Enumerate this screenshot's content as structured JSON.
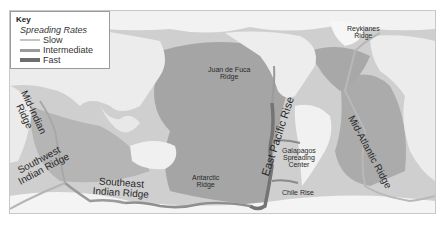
{
  "key": {
    "title": "Key",
    "subtitle": "Spreading Rates",
    "items": [
      {
        "label": "Slow",
        "color": "#c4c4c4",
        "width": 2
      },
      {
        "label": "Intermediate",
        "color": "#9a9a9a",
        "width": 3
      },
      {
        "label": "Fast",
        "color": "#6e6e6e",
        "width": 4
      }
    ]
  },
  "ridges": {
    "reykjanes": "Reykjanes Ridge",
    "reykjanes_l1": "Reykjanes",
    "reykjanes_l2": "Ridge",
    "juan_de_fuca_l1": "Juan de Fuca",
    "juan_de_fuca_l2": "Ridge",
    "mid_indian_l1": "Mid-Indian",
    "mid_indian_l2": "Ridge",
    "southwest_indian_l1": "Southwest",
    "southwest_indian_l2": "Indian Ridge",
    "southeast_indian_l1": "Southeast",
    "southeast_indian_l2": "Indian Ridge",
    "antarctic_l1": "Antarctic",
    "antarctic_l2": "Ridge",
    "east_pacific_rise": "East Pacific Rise",
    "galapagos_l1": "Galapagos",
    "galapagos_l2": "Spreading",
    "galapagos_l3": "Center",
    "chile_rise": "Chile Rise",
    "mid_atlantic": "Mid-Atlantic Ridge"
  },
  "colors": {
    "ocean_deep": "#9c9c9c",
    "ocean_shallow": "#c9c9c9",
    "land": "#eeeeee",
    "ice": "#f7f7f7",
    "ridge": "#7a7a7a"
  }
}
